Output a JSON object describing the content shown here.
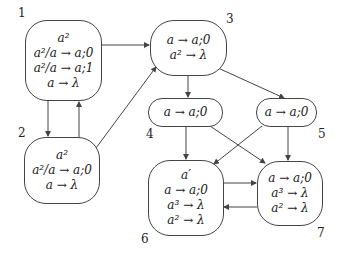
{
  "diagram": {
    "nodes": [
      {
        "id": "1",
        "lines": [
          "a²",
          "a²/a → a;0",
          "a²/a → a;1",
          "a → λ"
        ]
      },
      {
        "id": "2",
        "lines": [
          "a²",
          "a²/a → a;0",
          "a → λ"
        ]
      },
      {
        "id": "3",
        "lines": [
          "a → a;0",
          "a² → λ"
        ]
      },
      {
        "id": "4",
        "lines": [
          "a → a;0"
        ]
      },
      {
        "id": "5",
        "lines": [
          "a → a;0"
        ]
      },
      {
        "id": "6",
        "lines": [
          "a′",
          "a → a;0",
          "a³ → λ",
          "a² → λ"
        ]
      },
      {
        "id": "7",
        "lines": [
          "a → a;0",
          "a³ → λ",
          "a² → λ"
        ]
      }
    ],
    "edges": [
      {
        "from": "1",
        "to": "2"
      },
      {
        "from": "2",
        "to": "1"
      },
      {
        "from": "1",
        "to": "3"
      },
      {
        "from": "2",
        "to": "3"
      },
      {
        "from": "3",
        "to": "4"
      },
      {
        "from": "3",
        "to": "5"
      },
      {
        "from": "4",
        "to": "6"
      },
      {
        "from": "4",
        "to": "7"
      },
      {
        "from": "5",
        "to": "6"
      },
      {
        "from": "5",
        "to": "7"
      },
      {
        "from": "6",
        "to": "7"
      },
      {
        "from": "7",
        "to": "6"
      }
    ],
    "colors": {
      "stroke": "#444444",
      "text": "#222222",
      "background": "#ffffff"
    }
  }
}
